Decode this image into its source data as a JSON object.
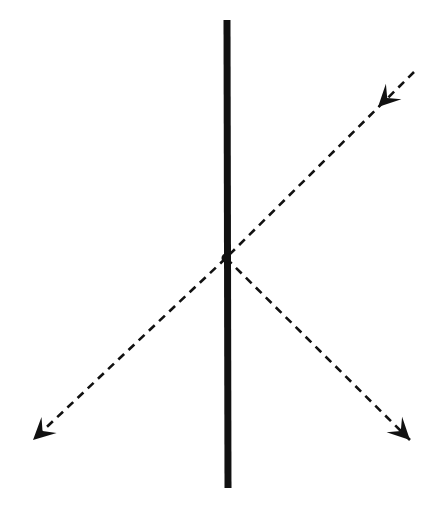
{
  "diagram": {
    "type": "ray-diagram",
    "background": "#ffffff",
    "ink_color": "#111111",
    "surface": {
      "x1": 227,
      "y1": 20,
      "x2": 228,
      "y2": 488,
      "width": 7
    },
    "intersection": {
      "x": 226,
      "y": 258
    },
    "rays": [
      {
        "name": "incident-ray",
        "from": [
          414,
          72
        ],
        "to": [
          226,
          258
        ],
        "arrow_at": [
          378,
          107
        ]
      },
      {
        "name": "transmitted-ray",
        "from": [
          226,
          258
        ],
        "to": [
          33,
          440
        ],
        "arrow_at": [
          33,
          440
        ]
      },
      {
        "name": "reflected-ray",
        "from": [
          226,
          258
        ],
        "to": [
          410,
          440
        ],
        "arrow_at": [
          410,
          440
        ]
      }
    ],
    "dash": "8,6",
    "ray_width": 2.6
  }
}
